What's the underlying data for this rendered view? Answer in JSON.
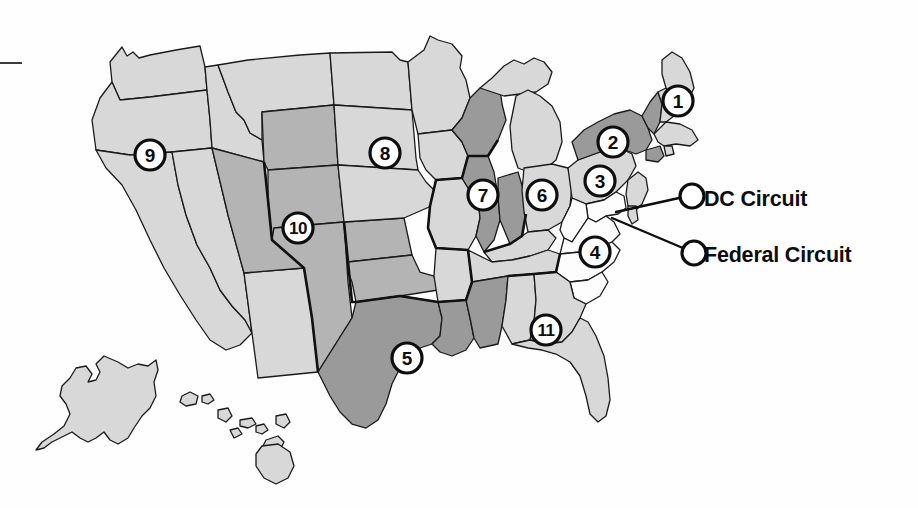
{
  "figure": {
    "background_color": "#fefefe",
    "ink_color": "#0d0d0d"
  },
  "legend": {
    "items": [
      {
        "id": "dc",
        "label": "DC Circuit",
        "marker": "open-circle"
      },
      {
        "id": "federal",
        "label": "Federal Circuit",
        "marker": "open-circle"
      }
    ]
  },
  "markers": [
    {
      "id": "c1",
      "label": "1",
      "x": 678,
      "y": 101,
      "region": "New England"
    },
    {
      "id": "c2",
      "label": "2",
      "x": 613,
      "y": 142,
      "region": "New York"
    },
    {
      "id": "c3",
      "label": "3",
      "x": 600,
      "y": 181,
      "region": "Pennsylvania"
    },
    {
      "id": "c4",
      "label": "4",
      "x": 595,
      "y": 252,
      "region": "Virginia / Carolinas"
    },
    {
      "id": "c5",
      "label": "5",
      "x": 407,
      "y": 358,
      "region": "Texas / Louisiana / Mississippi"
    },
    {
      "id": "c6",
      "label": "6",
      "x": 542,
      "y": 195,
      "region": "Ohio / Michigan / Kentucky / Tennessee"
    },
    {
      "id": "c7",
      "label": "7",
      "x": 483,
      "y": 195,
      "region": "Illinois / Indiana / Wisconsin"
    },
    {
      "id": "c8",
      "label": "8",
      "x": 385,
      "y": 153,
      "region": "Upper Midwest"
    },
    {
      "id": "c9",
      "label": "9",
      "x": 150,
      "y": 155,
      "region": "West Coast"
    },
    {
      "id": "c10",
      "label": "10",
      "x": 298,
      "y": 228,
      "region": "Mountain West"
    },
    {
      "id": "c11",
      "label": "11",
      "x": 546,
      "y": 330,
      "region": "Alabama / Georgia / Florida"
    }
  ],
  "shading": {
    "light": "#d8d8d8",
    "medium": "#b4b4b4",
    "dark": "#9a9a9a",
    "white": "#fdfdfd"
  }
}
